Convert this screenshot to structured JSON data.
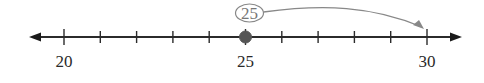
{
  "number_line": {
    "min": 20,
    "max": 30,
    "tick_step": 1,
    "labeled_ticks": [
      {
        "value": 20,
        "label": "20"
      },
      {
        "value": 25,
        "label": "25"
      },
      {
        "value": 30,
        "label": "30"
      }
    ],
    "arrows_both_ends": true,
    "line_color": "#2b2b2b"
  },
  "point": {
    "value": 25,
    "filled": true,
    "color": "#555555"
  },
  "callout": {
    "label": "25",
    "shape": "oval",
    "color": "#888888"
  },
  "jump_arrow": {
    "from": 25,
    "to": 30,
    "color": "#888888"
  }
}
